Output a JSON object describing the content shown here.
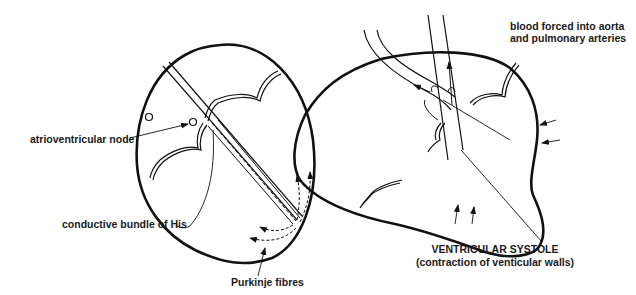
{
  "figure": {
    "left_panel": {
      "name": "conduction system of the heart",
      "labels": {
        "av_node": "atrioventricular node",
        "bundle_of_his": "conductive bundle of His",
        "purkinje": "Purkinje fibres"
      }
    },
    "right_panel": {
      "name": "ventricular systole",
      "labels": {
        "blood_line1": "blood forced into aorta",
        "blood_line2": "and pulmonary arteries",
        "title": "VENTRICULAR SYSTOLE",
        "subtitle": "(contraction of venticular walls)"
      }
    },
    "colors": {
      "line": "#111111",
      "background": "#ffffff"
    }
  }
}
